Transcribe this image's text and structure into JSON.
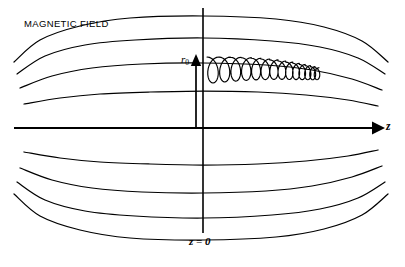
{
  "figure": {
    "background_color": "#ffffff",
    "line_color": "#000000",
    "width": 405,
    "height": 267
  },
  "labels": {
    "magnetic_field": "MAGNETIC FIELD",
    "radius_symbol": "r",
    "radius_subscript": "0",
    "axis_z": "z",
    "midplane": "z = 0"
  },
  "chart_data": {
    "type": "line",
    "xlabel": "z",
    "ylabel": "r",
    "annotations": [
      "MAGNETIC FIELD",
      "r0",
      "z",
      "z = 0"
    ],
    "grid": false,
    "legend": false,
    "axis": {
      "z_axis": {
        "label": "z",
        "y_pixel": 128,
        "x_start": 14,
        "x_end": 375,
        "arrow": "right",
        "stroke_width": 2.2
      },
      "vertical_axis": {
        "label": "z = 0",
        "x_pixel": 203,
        "y_start": 8,
        "y_end": 233,
        "stroke_width": 1.6
      },
      "r0_arrow": {
        "label": "r0",
        "x_pixel": 196,
        "y_base": 128,
        "y_tip": 57,
        "arrow": "up"
      }
    },
    "series": [
      {
        "name": "fieldline-upper-4",
        "half": "upper",
        "index": 4,
        "mid_radius": 112,
        "throat_radius": 50,
        "points": [
          [
            14,
            62
          ],
          [
            40,
            40
          ],
          [
            80,
            26
          ],
          [
            130,
            18
          ],
          [
            203,
            16
          ],
          [
            276,
            19
          ],
          [
            324,
            27
          ],
          [
            362,
            41
          ],
          [
            388,
            62
          ]
        ]
      },
      {
        "name": "fieldline-upper-3",
        "half": "upper",
        "index": 3,
        "mid_radius": 82,
        "throat_radius": 38,
        "points": [
          [
            17,
            74
          ],
          [
            45,
            56
          ],
          [
            85,
            45
          ],
          [
            135,
            40
          ],
          [
            203,
            38
          ],
          [
            272,
            41
          ],
          [
            320,
            47
          ],
          [
            358,
            58
          ],
          [
            385,
            74
          ]
        ]
      },
      {
        "name": "fieldline-upper-2",
        "half": "upper",
        "index": 2,
        "mid_radius": 54,
        "throat_radius": 26,
        "points": [
          [
            20,
            88
          ],
          [
            52,
            76
          ],
          [
            92,
            68
          ],
          [
            142,
            64
          ],
          [
            203,
            63
          ],
          [
            266,
            65
          ],
          [
            312,
            70
          ],
          [
            352,
            79
          ],
          [
            382,
            90
          ]
        ]
      },
      {
        "name": "fieldline-upper-1",
        "half": "upper",
        "index": 1,
        "mid_radius": 28,
        "throat_radius": 14,
        "points": [
          [
            24,
            104
          ],
          [
            60,
            98
          ],
          [
            100,
            94
          ],
          [
            150,
            92
          ],
          [
            203,
            91
          ],
          [
            258,
            92
          ],
          [
            306,
            95
          ],
          [
            348,
            100
          ],
          [
            378,
            106
          ]
        ]
      },
      {
        "name": "fieldline-lower-1",
        "half": "lower",
        "index": 1,
        "mid_radius": -28,
        "throat_radius": -14,
        "points": [
          [
            24,
            152
          ],
          [
            60,
            158
          ],
          [
            100,
            162
          ],
          [
            150,
            164
          ],
          [
            203,
            165
          ],
          [
            258,
            164
          ],
          [
            306,
            161
          ],
          [
            348,
            156
          ],
          [
            378,
            150
          ]
        ]
      },
      {
        "name": "fieldline-lower-2",
        "half": "lower",
        "index": 2,
        "mid_radius": -54,
        "throat_radius": -26,
        "points": [
          [
            20,
            168
          ],
          [
            52,
            180
          ],
          [
            92,
            188
          ],
          [
            142,
            192
          ],
          [
            203,
            193
          ],
          [
            266,
            191
          ],
          [
            312,
            186
          ],
          [
            352,
            177
          ],
          [
            382,
            166
          ]
        ]
      },
      {
        "name": "fieldline-lower-3",
        "half": "lower",
        "index": 3,
        "mid_radius": -82,
        "throat_radius": -38,
        "points": [
          [
            17,
            182
          ],
          [
            45,
            200
          ],
          [
            85,
            211
          ],
          [
            135,
            216
          ],
          [
            203,
            218
          ],
          [
            272,
            215
          ],
          [
            320,
            209
          ],
          [
            358,
            198
          ],
          [
            385,
            182
          ]
        ]
      },
      {
        "name": "fieldline-lower-4",
        "half": "lower",
        "index": 4,
        "mid_radius": -112,
        "throat_radius": -50,
        "points": [
          [
            14,
            194
          ],
          [
            40,
            216
          ],
          [
            80,
            230
          ],
          [
            130,
            238
          ],
          [
            203,
            240
          ],
          [
            276,
            237
          ],
          [
            324,
            229
          ],
          [
            362,
            215
          ],
          [
            388,
            194
          ]
        ]
      }
    ],
    "particle_trajectory": {
      "name": "helical-gyro-orbit",
      "description": "Charged particle spiraling along a field line; gyroradius shrinks as field strength increases toward the mirror throat",
      "z_start": 207,
      "z_end": 313,
      "guiding_center_y": 70,
      "loop_count": 14,
      "gyroradius_start": 13,
      "gyroradius_end": 6,
      "pitch_start": 12,
      "pitch_end": 4
    }
  }
}
